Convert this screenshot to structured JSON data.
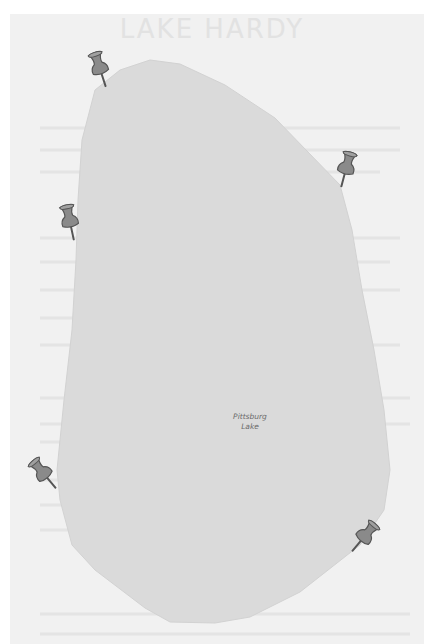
{
  "map": {
    "title": "LAKE HARDY",
    "lake": {
      "name_line1": "Pittsburg",
      "name_line2": "Lake",
      "fill_color": "#dadada",
      "outline_points": "150,60 180,64 225,85 275,118 340,185 352,230 362,290 374,350 384,410 390,470 384,510 360,545 300,592 250,617 215,623 170,622 145,608 95,570 72,545 60,500 57,470 64,400 72,330 76,260 78,200 82,140 95,90 120,70"
    },
    "pins": [
      {
        "id": "pin-top-left",
        "x": 86,
        "y": 50,
        "rotation": -18
      },
      {
        "id": "pin-right-upper",
        "x": 332,
        "y": 150,
        "rotation": 15
      },
      {
        "id": "pin-left-middle",
        "x": 56,
        "y": 203,
        "rotation": -12
      },
      {
        "id": "pin-left-lower",
        "x": 30,
        "y": 455,
        "rotation": -40
      },
      {
        "id": "pin-right-lower",
        "x": 350,
        "y": 518,
        "rotation": 40
      }
    ],
    "colors": {
      "outer_background": "#ffffff",
      "paper": "#f1f1f1",
      "lake_fill": "#dadada",
      "pin_body": "#8a8a8a",
      "pin_outline": "#555555",
      "label": "#6a6a6a"
    }
  }
}
